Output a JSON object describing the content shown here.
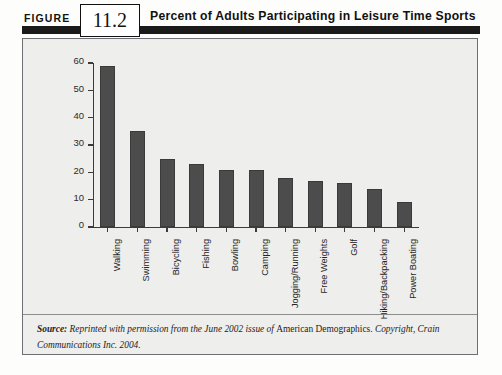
{
  "header": {
    "figure_word": "FIGURE",
    "figure_number": "11.2",
    "title": "Percent of Adults Participating in Leisure Time Sports"
  },
  "source": {
    "label": "Source:",
    "text_before": " Reprinted with permission from the June 2002 issue of ",
    "publication": "American Demographics.",
    "text_after": " Copyright, Crain Communications Inc. 2004."
  },
  "colors": {
    "bar_fill": "#4c4c4c",
    "panel_background": "#eeeeec",
    "panel_border": "#6d6f74",
    "header_band": "#1a1a1a",
    "axis": "#3b3b3b"
  },
  "chart_data": {
    "type": "bar",
    "title": "Percent of Adults Participating in Leisure Time Sports",
    "xlabel": "",
    "ylabel": "",
    "ylim": [
      0,
      60
    ],
    "yticks": [
      0,
      10,
      20,
      30,
      40,
      50,
      60
    ],
    "grid": false,
    "legend": null,
    "categories": [
      "Walking",
      "Swimming",
      "Bicycling",
      "Fishing",
      "Bowling",
      "Camping",
      "Jogging/Running",
      "Free Weights",
      "Golf",
      "Hiking/Backpacking",
      "Power Boating"
    ],
    "values": [
      59,
      35,
      25,
      23,
      21,
      21,
      18,
      17,
      16,
      14,
      9
    ]
  }
}
